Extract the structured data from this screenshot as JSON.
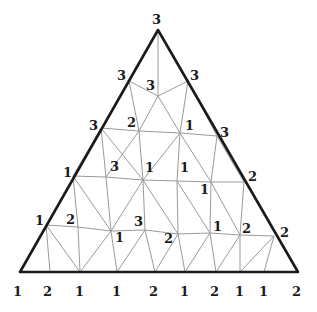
{
  "diagram": {
    "title": "",
    "outer_triangle": [
      [
        158,
        30
      ],
      [
        20,
        272
      ],
      [
        298,
        272
      ]
    ],
    "vertices": [
      {
        "id": "top",
        "x": 158,
        "y": 30,
        "label": "3",
        "lx": 152,
        "ly": 24
      },
      {
        "id": "l1",
        "x": 129,
        "y": 81,
        "label": "3",
        "lx": 117,
        "ly": 80
      },
      {
        "id": "c1",
        "x": 158,
        "y": 96,
        "label": "3",
        "lx": 146,
        "ly": 90
      },
      {
        "id": "r1",
        "x": 188,
        "y": 81,
        "label": "3",
        "lx": 190,
        "ly": 80
      },
      {
        "id": "l2",
        "x": 101,
        "y": 128,
        "label": "3",
        "lx": 89,
        "ly": 130
      },
      {
        "id": "p2a",
        "x": 139,
        "y": 131,
        "label": "2",
        "lx": 127,
        "ly": 127
      },
      {
        "id": "p2b",
        "x": 180,
        "y": 133,
        "label": "1",
        "lx": 185,
        "ly": 130
      },
      {
        "id": "r2",
        "x": 217,
        "y": 136,
        "label": "3",
        "lx": 220,
        "ly": 137
      },
      {
        "id": "l3",
        "x": 73,
        "y": 176,
        "label": "1",
        "lx": 63,
        "ly": 177
      },
      {
        "id": "p3a",
        "x": 106,
        "y": 177,
        "label": "3",
        "lx": 110,
        "ly": 171
      },
      {
        "id": "p3b",
        "x": 143,
        "y": 180,
        "label": "1",
        "lx": 145,
        "ly": 172
      },
      {
        "id": "p3c",
        "x": 177,
        "y": 181,
        "label": "1",
        "lx": 180,
        "ly": 172
      },
      {
        "id": "p3d",
        "x": 211,
        "y": 182,
        "label": "1",
        "lx": 200,
        "ly": 194
      },
      {
        "id": "r3",
        "x": 244,
        "y": 182,
        "label": "2",
        "lx": 248,
        "ly": 181
      },
      {
        "id": "l4",
        "x": 46,
        "y": 225,
        "label": "1",
        "lx": 35,
        "ly": 225
      },
      {
        "id": "p4a",
        "x": 78,
        "y": 227,
        "label": "2",
        "lx": 66,
        "ly": 224
      },
      {
        "id": "p4b",
        "x": 111,
        "y": 231,
        "label": "1",
        "lx": 115,
        "ly": 242
      },
      {
        "id": "p4c",
        "x": 145,
        "y": 230,
        "label": "3",
        "lx": 134,
        "ly": 226
      },
      {
        "id": "p4d",
        "x": 178,
        "y": 234,
        "label": "2",
        "lx": 164,
        "ly": 243
      },
      {
        "id": "p4e",
        "x": 210,
        "y": 233,
        "label": "1",
        "lx": 213,
        "ly": 231
      },
      {
        "id": "p4f",
        "x": 240,
        "y": 235,
        "label": "2",
        "lx": 242,
        "ly": 233
      },
      {
        "id": "r4",
        "x": 274,
        "y": 236,
        "label": "2",
        "lx": 280,
        "ly": 237
      },
      {
        "id": "b0",
        "x": 20,
        "y": 272,
        "label": "1",
        "lx": 13,
        "ly": 296
      },
      {
        "id": "b1",
        "x": 50,
        "y": 272,
        "label": "2",
        "lx": 43,
        "ly": 296
      },
      {
        "id": "b2",
        "x": 80,
        "y": 272,
        "label": "1",
        "lx": 75,
        "ly": 296
      },
      {
        "id": "b3",
        "x": 117,
        "y": 272,
        "label": "1",
        "lx": 112,
        "ly": 296
      },
      {
        "id": "b4",
        "x": 155,
        "y": 272,
        "label": "2",
        "lx": 149,
        "ly": 296
      },
      {
        "id": "b5",
        "x": 185,
        "y": 272,
        "label": "1",
        "lx": 180,
        "ly": 296
      },
      {
        "id": "b6",
        "x": 216,
        "y": 272,
        "label": "2",
        "lx": 210,
        "ly": 296
      },
      {
        "id": "b7",
        "x": 240,
        "y": 272,
        "label": "1",
        "lx": 235,
        "ly": 296
      },
      {
        "id": "b8",
        "x": 264,
        "y": 272,
        "label": "1",
        "lx": 259,
        "ly": 296
      },
      {
        "id": "b9",
        "x": 298,
        "y": 272,
        "label": "2",
        "lx": 292,
        "ly": 296
      }
    ],
    "mesh_edges": [
      [
        "top",
        "c1"
      ],
      [
        "l1",
        "c1"
      ],
      [
        "c1",
        "r1"
      ],
      [
        "l1",
        "p2a"
      ],
      [
        "c1",
        "p2a"
      ],
      [
        "c1",
        "p2b"
      ],
      [
        "r1",
        "p2b"
      ],
      [
        "r1",
        "r2"
      ],
      [
        "l2",
        "p2a"
      ],
      [
        "p2a",
        "p2b"
      ],
      [
        "p2b",
        "r2"
      ],
      [
        "l2",
        "p3b"
      ],
      [
        "p2a",
        "p3a"
      ],
      [
        "p2a",
        "p3b"
      ],
      [
        "p2b",
        "p3b"
      ],
      [
        "p2b",
        "p3c"
      ],
      [
        "p2b",
        "p3d"
      ],
      [
        "r2",
        "p3d"
      ],
      [
        "r2",
        "r3"
      ],
      [
        "l2",
        "l3"
      ],
      [
        "l2",
        "p3a"
      ],
      [
        "l3",
        "p3a"
      ],
      [
        "p3a",
        "p3b"
      ],
      [
        "p3b",
        "p3c"
      ],
      [
        "p3c",
        "p3d"
      ],
      [
        "p3d",
        "r3"
      ],
      [
        "l3",
        "p4a"
      ],
      [
        "l3",
        "p4b"
      ],
      [
        "p3a",
        "p4b"
      ],
      [
        "p3b",
        "p4b"
      ],
      [
        "p3b",
        "p4c"
      ],
      [
        "p3b",
        "p4d"
      ],
      [
        "p3c",
        "p4d"
      ],
      [
        "p3c",
        "p4e"
      ],
      [
        "p3d",
        "p4e"
      ],
      [
        "p3d",
        "p4f"
      ],
      [
        "r3",
        "p4f"
      ],
      [
        "l4",
        "p4a"
      ],
      [
        "p4a",
        "p4b"
      ],
      [
        "p4b",
        "p4c"
      ],
      [
        "p4c",
        "p4d"
      ],
      [
        "p4d",
        "p4e"
      ],
      [
        "p4e",
        "p4f"
      ],
      [
        "p4f",
        "r4"
      ],
      [
        "l4",
        "b1"
      ],
      [
        "l4",
        "b2"
      ],
      [
        "p4a",
        "b2"
      ],
      [
        "p4b",
        "b2"
      ],
      [
        "p4b",
        "b3"
      ],
      [
        "p4c",
        "b3"
      ],
      [
        "p4c",
        "b4"
      ],
      [
        "p4d",
        "b4"
      ],
      [
        "p4d",
        "b5"
      ],
      [
        "p4e",
        "b5"
      ],
      [
        "p4e",
        "b6"
      ],
      [
        "p4f",
        "b6"
      ],
      [
        "p4f",
        "b7"
      ],
      [
        "r4",
        "b7"
      ],
      [
        "r4",
        "b8"
      ]
    ]
  }
}
